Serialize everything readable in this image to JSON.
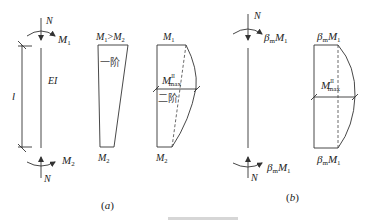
{
  "diagram": {
    "panel_a": {
      "caption": "(a)",
      "column": {
        "top_force": "N",
        "top_moment": "M1",
        "stiffness": "EI",
        "length": "l",
        "bottom_moment": "M2",
        "bottom_force": "N"
      },
      "first_order_diagram": {
        "top_label": "M1>M2",
        "order_label": "一阶",
        "bottom_label": "M2"
      },
      "second_order_diagram": {
        "top_label": "M1",
        "max_label": "M",
        "max_sup": "II",
        "max_sub": "max",
        "order_label": "二阶",
        "bottom_label": "M2"
      }
    },
    "panel_b": {
      "caption": "(b)",
      "column": {
        "top_force": "N",
        "top_moment_coef": "β",
        "top_moment_sub": "m",
        "top_moment": "M1",
        "bottom_moment_coef": "β",
        "bottom_moment_sub": "m",
        "bottom_moment": "M1",
        "bottom_force": "N"
      },
      "moment_diagram": {
        "top_label_coef": "β",
        "top_label_sub": "m",
        "top_label": "M1",
        "max_label": "M",
        "max_sup": "II",
        "max_sub": "max",
        "bottom_label_coef": "β",
        "bottom_label_sub": "m",
        "bottom_label": "M1"
      }
    },
    "figure_caption_partial": "……"
  }
}
